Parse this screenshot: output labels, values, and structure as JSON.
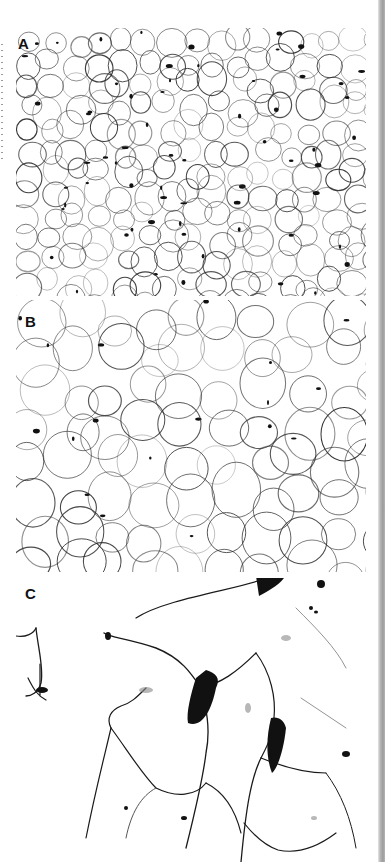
{
  "figure": {
    "panels": [
      {
        "label": "A",
        "content": "adipose tissue micrograph, low magnification, many small adipocytes"
      },
      {
        "label": "B",
        "content": "adipose tissue micrograph, medium magnification"
      },
      {
        "label": "C",
        "content": "adipose tissue micrograph, high magnification, large adipocytes with dark stromal cells"
      }
    ]
  },
  "colors": {
    "background": "#ffffff",
    "stain": "#1a1a1a",
    "gutter": "#a0a0a0"
  }
}
